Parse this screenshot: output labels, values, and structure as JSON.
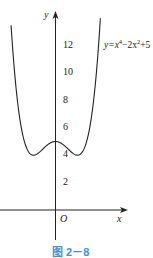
{
  "chart_data": {
    "type": "line",
    "title": "",
    "caption": "图 2－8",
    "function_label": "y=x⁴−2x²+5",
    "xlabel": "x",
    "ylabel": "y",
    "origin_label": "O",
    "y_ticks": [
      2,
      4,
      6,
      8,
      10,
      12
    ],
    "y_tick_labels": [
      "2",
      "4",
      "6",
      "8",
      "10",
      "12"
    ],
    "x_ticks": [],
    "xlim": [
      -2.5,
      3.3
    ],
    "ylim": [
      -1.5,
      14.5
    ],
    "grid": false,
    "legend": "none",
    "series": [
      {
        "name": "y=x^4-2x^2+5",
        "x": [
          -2.02,
          -1.8,
          -1.6,
          -1.4,
          -1.2,
          -1.0,
          -0.8,
          -0.6,
          -0.4,
          -0.2,
          0,
          0.2,
          0.4,
          0.6,
          0.8,
          1.0,
          1.2,
          1.4,
          1.6,
          1.8,
          2.04
        ],
        "values": [
          13.49,
          8.02,
          6.43,
          4.92,
          4.19,
          4.0,
          4.13,
          4.41,
          4.71,
          4.92,
          5.0,
          4.92,
          4.71,
          4.41,
          4.13,
          4.0,
          4.19,
          4.92,
          6.43,
          8.02,
          13.0
        ]
      }
    ],
    "key_points": [
      {
        "label": "local max",
        "x": 0,
        "y": 5
      },
      {
        "label": "local min",
        "x": -1,
        "y": 4
      },
      {
        "label": "local min",
        "x": 1,
        "y": 4
      }
    ]
  },
  "labels": {
    "y_axis": "y",
    "x_axis": "x",
    "origin": "O",
    "equation_prefix": "y=x",
    "equation_exp1": "4",
    "equation_mid": "−2x",
    "equation_exp2": "2",
    "equation_suffix": "+5",
    "tick_12": "12",
    "tick_10": "10",
    "tick_8": "8",
    "tick_6": "6",
    "tick_4": "4",
    "tick_2": "2",
    "caption": "图 2－8"
  }
}
